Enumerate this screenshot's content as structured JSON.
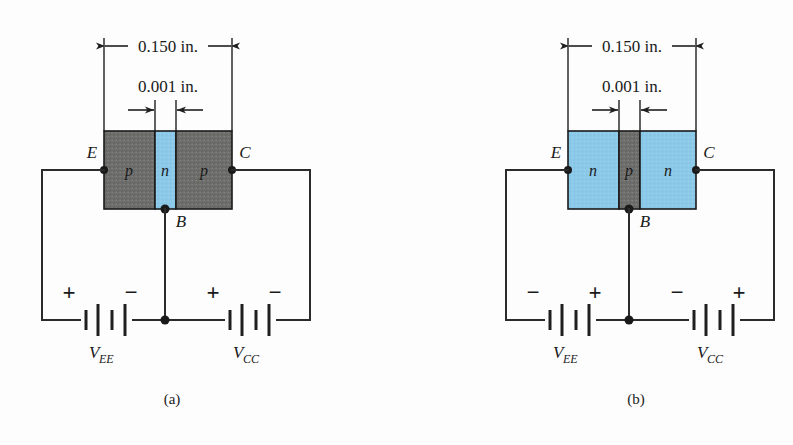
{
  "figure": {
    "caption_a": "(a)",
    "caption_b": "(b)",
    "colors": {
      "p_region": "#6e6e6c",
      "n_region": "#8cc8e8",
      "wire": "#2b2b2b",
      "text": "#1a1a1a",
      "background": "#fdfdfd"
    }
  },
  "panel_a": {
    "id": "pnp",
    "caption": "(a)",
    "dimensions": {
      "overall": "0.150 in.",
      "base_width": "0.001 in."
    },
    "terminals": {
      "emitter": "E",
      "base": "B",
      "collector": "C"
    },
    "regions": [
      {
        "label": "p",
        "type": "p",
        "color": "#6e6e6c"
      },
      {
        "label": "n",
        "type": "n",
        "color": "#8cc8e8"
      },
      {
        "label": "p",
        "type": "p",
        "color": "#6e6e6c"
      }
    ],
    "sources": [
      {
        "name": "V_EE",
        "symbol": "V",
        "subscript": "EE",
        "left_sign": "+",
        "right_sign": "−"
      },
      {
        "name": "V_CC",
        "symbol": "V",
        "subscript": "CC",
        "left_sign": "+",
        "right_sign": "−"
      }
    ]
  },
  "panel_b": {
    "id": "npn",
    "caption": "(b)",
    "dimensions": {
      "overall": "0.150 in.",
      "base_width": "0.001 in."
    },
    "terminals": {
      "emitter": "E",
      "base": "B",
      "collector": "C"
    },
    "regions": [
      {
        "label": "n",
        "type": "n",
        "color": "#8cc8e8"
      },
      {
        "label": "p",
        "type": "p",
        "color": "#6e6e6c"
      },
      {
        "label": "n",
        "type": "n",
        "color": "#8cc8e8"
      }
    ],
    "sources": [
      {
        "name": "V_EE",
        "symbol": "V",
        "subscript": "EE",
        "left_sign": "−",
        "right_sign": "+"
      },
      {
        "name": "V_CC",
        "symbol": "V",
        "subscript": "CC",
        "left_sign": "−",
        "right_sign": "+"
      }
    ]
  }
}
